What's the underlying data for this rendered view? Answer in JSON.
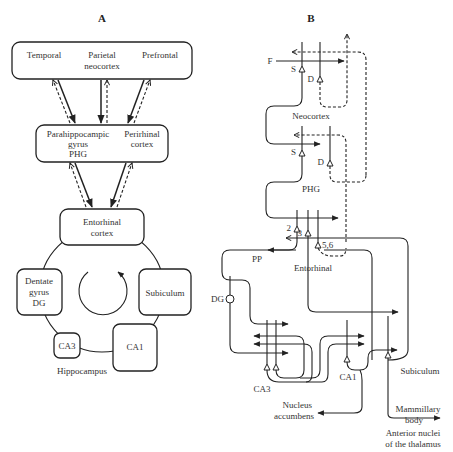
{
  "panel_a": {
    "title": "A",
    "cortex_box": {
      "temporal": "Temporal",
      "parietal_line1": "Parietal",
      "parietal_line2": "neocortex",
      "prefrontal": "Prefrontal"
    },
    "mid_box": {
      "phg_line1": "Parahippocampic",
      "phg_line2": "gyrus",
      "phg_line3": "PHG",
      "perirhinal_line1": "Perirhinal",
      "perirhinal_line2": "cortex"
    },
    "entorhinal_line1": "Entorhinal",
    "entorhinal_line2": "cortex",
    "dg_line1": "Dentate",
    "dg_line2": "gyrus",
    "dg_line3": "DG",
    "subiculum": "Subiculum",
    "ca3": "CA3",
    "ca1": "CA1",
    "hippocampus": "Hippocampus"
  },
  "panel_b": {
    "title": "B",
    "f": "F",
    "s1": "S",
    "d1": "D",
    "neocortex": "Neocortex",
    "s2": "S",
    "d2": "D",
    "phg": "PHG",
    "layer2": "2",
    "layer3": "3",
    "layer56": "5,6",
    "pp": "PP",
    "entorhinal": "Entorhinal",
    "dg": "DG",
    "ca3": "CA3",
    "ca1": "CA1",
    "subiculum": "Subiculum",
    "nucleus_line1": "Nucleus",
    "nucleus_line2": "accumbens",
    "mammillary_line1": "Mammillary",
    "mammillary_line2": "body",
    "anterior_line1": "Anterior nuclei",
    "anterior_line2": "of the thalamus"
  }
}
